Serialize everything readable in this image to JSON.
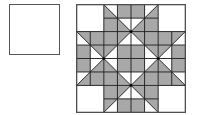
{
  "figure": {
    "small_square": {
      "label": ""
    },
    "quilt": {
      "grid_units": 8,
      "colors": {
        "fill_gray": "#a8a8a8",
        "fill_white": "#ffffff",
        "stroke": "#222222",
        "border": "#444444"
      },
      "quadrant_gray_polygons": [
        [
          [
            2,
            0
          ],
          [
            2,
            2
          ],
          [
            4,
            2
          ]
        ],
        [
          [
            3,
            0
          ],
          [
            4,
            0
          ],
          [
            4,
            1
          ],
          [
            3,
            1
          ]
        ],
        [
          [
            0,
            2
          ],
          [
            2,
            2
          ],
          [
            2,
            4
          ]
        ],
        [
          [
            0,
            3
          ],
          [
            1,
            3
          ],
          [
            1,
            4
          ],
          [
            0,
            4
          ]
        ],
        [
          [
            2,
            2
          ],
          [
            4,
            2
          ],
          [
            2,
            4
          ]
        ],
        [
          [
            3,
            3
          ],
          [
            4,
            3
          ],
          [
            4,
            4
          ],
          [
            3,
            4
          ]
        ]
      ],
      "lines": [
        [
          [
            2,
            0
          ],
          [
            2,
            8
          ]
        ],
        [
          [
            6,
            0
          ],
          [
            6,
            8
          ]
        ],
        [
          [
            0,
            2
          ],
          [
            8,
            2
          ]
        ],
        [
          [
            0,
            6
          ],
          [
            8,
            6
          ]
        ],
        [
          [
            3,
            0
          ],
          [
            3,
            8
          ]
        ],
        [
          [
            4,
            0
          ],
          [
            4,
            8
          ]
        ],
        [
          [
            5,
            0
          ],
          [
            5,
            8
          ]
        ],
        [
          [
            0,
            3
          ],
          [
            8,
            3
          ]
        ],
        [
          [
            0,
            4
          ],
          [
            8,
            4
          ]
        ],
        [
          [
            0,
            5
          ],
          [
            8,
            5
          ]
        ],
        [
          [
            2,
            1
          ],
          [
            6,
            1
          ]
        ],
        [
          [
            2,
            7
          ],
          [
            6,
            7
          ]
        ],
        [
          [
            1,
            2
          ],
          [
            1,
            6
          ]
        ],
        [
          [
            7,
            2
          ],
          [
            7,
            6
          ]
        ],
        [
          [
            2,
            0
          ],
          [
            4,
            2
          ]
        ],
        [
          [
            4,
            2
          ],
          [
            6,
            0
          ]
        ],
        [
          [
            0,
            2
          ],
          [
            2,
            4
          ]
        ],
        [
          [
            2,
            4
          ],
          [
            0,
            6
          ]
        ],
        [
          [
            8,
            2
          ],
          [
            6,
            4
          ]
        ],
        [
          [
            6,
            4
          ],
          [
            8,
            6
          ]
        ],
        [
          [
            2,
            8
          ],
          [
            4,
            6
          ]
        ],
        [
          [
            4,
            6
          ],
          [
            6,
            8
          ]
        ],
        [
          [
            4,
            2
          ],
          [
            6,
            4
          ]
        ],
        [
          [
            6,
            4
          ],
          [
            4,
            6
          ]
        ],
        [
          [
            4,
            6
          ],
          [
            2,
            4
          ]
        ],
        [
          [
            2,
            4
          ],
          [
            4,
            2
          ]
        ]
      ],
      "dots": [
        [
          4,
          2
        ],
        [
          2,
          4
        ],
        [
          6,
          4
        ],
        [
          4,
          6
        ]
      ]
    }
  }
}
